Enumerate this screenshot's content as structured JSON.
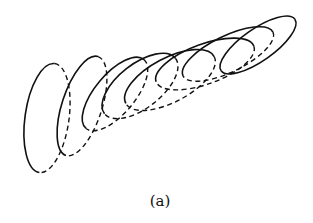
{
  "figure": {
    "caption": "(a)",
    "stroke_color": "#111111",
    "background": "#ffffff",
    "ellipses": [
      {
        "cx": 47,
        "cy": 118,
        "rx": 22,
        "ry": 55,
        "rot": 8
      },
      {
        "cx": 82,
        "cy": 106,
        "rx": 20,
        "ry": 52,
        "rot": 18
      },
      {
        "cx": 115,
        "cy": 94,
        "rx": 20,
        "ry": 45,
        "rot": 40
      },
      {
        "cx": 140,
        "cy": 86,
        "rx": 22,
        "ry": 45,
        "rot": 52
      },
      {
        "cx": 170,
        "cy": 80,
        "rx": 22,
        "ry": 50,
        "rot": 62
      },
      {
        "cx": 205,
        "cy": 64,
        "rx": 20,
        "ry": 52,
        "rot": 70
      },
      {
        "cx": 228,
        "cy": 54,
        "rx": 18,
        "ry": 50,
        "rot": 64
      },
      {
        "cx": 258,
        "cy": 45,
        "rx": 16,
        "ry": 45,
        "rot": 55
      }
    ]
  }
}
